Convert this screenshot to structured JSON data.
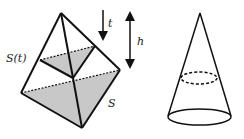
{
  "figure": {
    "left_panel": {
      "shape": "pyramid",
      "labels": {
        "cross_section": "S(t)",
        "base": "S",
        "time_param": "t",
        "height": "h"
      }
    },
    "right_panel": {
      "shape": "cone",
      "cross_section": "dashed-ellipse"
    },
    "colors": {
      "stroke": "#111111",
      "fill_shade": "#c8c8c8"
    }
  }
}
